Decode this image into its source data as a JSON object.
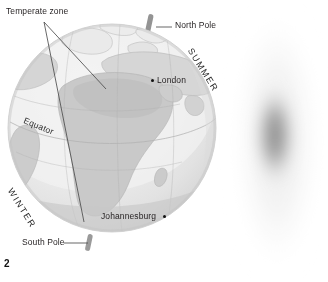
{
  "figure": {
    "number": "2",
    "type": "earth-seasons-diagram"
  },
  "labels": {
    "temperate_zone": "Temperate zone",
    "north_pole": "North Pole",
    "south_pole": "South Pole",
    "equator": "Equator",
    "summer": "SUMMER",
    "winter": "WINTER"
  },
  "cities": [
    {
      "name": "London",
      "dot_x": 152,
      "dot_y": 80.5,
      "label_x": 157,
      "label_y": 75.5
    },
    {
      "name": "Johannesburg",
      "dot_x": 164.5,
      "dot_y": 216,
      "label_x": 101,
      "label_y": 211
    }
  ],
  "colors": {
    "ocean_light": "#efefef",
    "ocean_mid": "#e3e3e3",
    "land": "#cfcfcf",
    "land_dark": "#bcbcbc",
    "coastline": "#b8b8b8",
    "shadow": "#d2d2d2",
    "axis_rod": "#8f8f8f",
    "leader_line": "#4a4a4a",
    "text": "#231f20",
    "beam_core": "#8d8d8d",
    "beam_outer": "#f4f4f4"
  },
  "beam": {
    "name": "light-beam-ellipse",
    "center_x": 277,
    "center_y": 141,
    "outer_rx": 41,
    "outer_ry": 133,
    "core_rx": 22,
    "core_ry": 55
  },
  "globe": {
    "center_x": 112,
    "center_y": 128,
    "radius": 104
  }
}
